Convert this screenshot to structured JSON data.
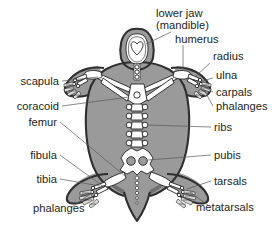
{
  "figure": {
    "view": "dorsal",
    "background_color": "#ffffff",
    "shell_color": "#9a9a9a",
    "shell_shadow_color": "#6f6f6f",
    "outline_color": "#2f2f2f",
    "bone_color": "#ffffff",
    "bone_outline_color": "#1a1a1a",
    "text_color": "#231f20",
    "leader_color": "#58595b"
  },
  "labels": {
    "lower_jaw": "lower jaw",
    "mandible": "(mandible)",
    "humerus": "humerus",
    "radius": "radius",
    "ulna": "ulna",
    "carpals": "carpals",
    "phalanges_front": "phalanges",
    "ribs": "ribs",
    "pubis": "pubis",
    "tarsals": "tarsals",
    "metatarsals": "metatarsals",
    "scapula": "scapula",
    "coracoid": "coracoid",
    "femur": "femur",
    "fibula": "fibula",
    "tibia": "tibia",
    "phalanges_hind": "phalanges"
  }
}
